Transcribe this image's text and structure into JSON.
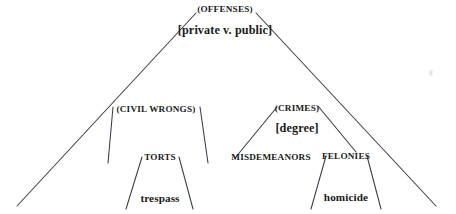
{
  "diagram": {
    "type": "tree-diagram",
    "width": 456,
    "height": 214,
    "background_color": "#ffffff",
    "line_color": "#3a3a4a",
    "text_color": "#1a1a1a",
    "nodes": [
      {
        "id": "offenses",
        "label": "(OFFENSES)",
        "style": "category",
        "x": 225,
        "y": 10
      },
      {
        "id": "private-v-public",
        "label": "[private v. public]",
        "style": "parameter",
        "x": 225,
        "y": 30
      },
      {
        "id": "civil-wrongs",
        "label": "(CIVIL WRONGS)",
        "style": "category",
        "x": 156,
        "y": 110
      },
      {
        "id": "crimes",
        "label": "(CRIMES)",
        "style": "category",
        "x": 297,
        "y": 109
      },
      {
        "id": "degree",
        "label": "[degree]",
        "style": "parameter",
        "x": 297,
        "y": 128
      },
      {
        "id": "torts",
        "label": "TORTS",
        "style": "category-plain",
        "x": 160,
        "y": 158
      },
      {
        "id": "misdemeanors",
        "label": "MISDEMEANORS",
        "style": "category-plain",
        "x": 271,
        "y": 158
      },
      {
        "id": "felonies",
        "label": "FELONIES",
        "style": "category-plain",
        "x": 346,
        "y": 157
      },
      {
        "id": "trespass",
        "label": "trespass",
        "style": "leaf",
        "x": 160,
        "y": 199
      },
      {
        "id": "homicide",
        "label": "homicide",
        "style": "leaf",
        "x": 346,
        "y": 198
      }
    ],
    "triangles": [
      {
        "id": "offenses-triangle",
        "apex_left": [
          196,
          13
        ],
        "apex_right": [
          256,
          13
        ],
        "base_left": [
          17,
          206
        ],
        "base_right": [
          436,
          206
        ]
      },
      {
        "id": "civil-wrongs-triangle",
        "apex_left": [
          113,
          107
        ],
        "apex_right": [
          200,
          107
        ],
        "base_left": [
          108,
          163
        ],
        "base_right": [
          208,
          163
        ]
      },
      {
        "id": "crimes-triangle",
        "apex_left": [
          277,
          107
        ],
        "apex_right": [
          318,
          106
        ],
        "base_left": [
          235,
          158
        ],
        "base_right": [
          356,
          152
        ]
      },
      {
        "id": "torts-triangle",
        "apex_left": [
          142,
          157
        ],
        "apex_right": [
          179,
          157
        ],
        "base_left": [
          126,
          209
        ],
        "base_right": [
          193,
          209
        ]
      },
      {
        "id": "felonies-triangle",
        "apex_left": [
          326,
          156
        ],
        "apex_right": [
          367,
          156
        ],
        "base_left": [
          311,
          209
        ],
        "base_right": [
          381,
          209
        ]
      }
    ],
    "artifacts": [
      {
        "id": "scan-speck",
        "x": 431,
        "y": 73
      }
    ]
  }
}
